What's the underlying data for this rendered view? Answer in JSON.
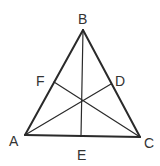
{
  "diagram": {
    "stroke_color": "#2a2a2a",
    "labels": {
      "A": "A",
      "B": "B",
      "C": "C",
      "D": "D",
      "E": "E",
      "F": "F"
    },
    "points": {
      "A": [
        25,
        135
      ],
      "B": [
        83,
        30
      ],
      "C": [
        140,
        137
      ],
      "D": [
        111,
        84
      ],
      "E": [
        81,
        136
      ],
      "F": [
        54,
        82
      ],
      "G": [
        82,
        100
      ]
    },
    "segments": [
      [
        "A",
        "B"
      ],
      [
        "B",
        "C"
      ],
      [
        "A",
        "C"
      ],
      [
        "B",
        "E"
      ],
      [
        "A",
        "D"
      ],
      [
        "C",
        "F"
      ]
    ]
  }
}
